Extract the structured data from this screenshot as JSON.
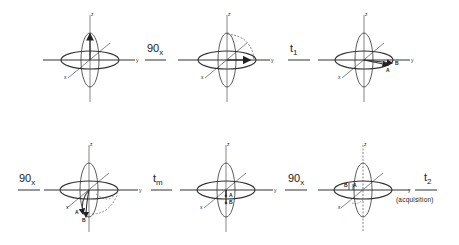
{
  "figure": {
    "type": "NMR pulse sequence vector diagram",
    "axes_labels": {
      "z": "z",
      "y": "y",
      "x": "x"
    },
    "steps": [
      {
        "id": "step1",
        "label": "",
        "description": "Equilibrium magnetization along z"
      },
      {
        "id": "step2",
        "arrow_label_main": "90",
        "arrow_label_sub": "x",
        "description": "After 90x pulse, magnetization rotated to y axis"
      },
      {
        "id": "step3",
        "arrow_label_main": "t",
        "arrow_label_sub": "1",
        "description": "Evolution during t1: vectors A and B dephase in xy plane"
      },
      {
        "id": "step4",
        "arrow_label_main": "90",
        "arrow_label_sub": "x",
        "description": "Second 90x pulse rotates A and B components toward -z"
      },
      {
        "id": "step5",
        "arrow_label_main": "t",
        "arrow_label_sub": "m",
        "description": "Mixing time tm: z components A and B remain"
      },
      {
        "id": "step6",
        "arrow_label_main": "90",
        "arrow_label_sub": "x",
        "description": "Third 90x pulse returns A and B to xy plane"
      }
    ],
    "final_arrow": {
      "main": "t",
      "sub": "2",
      "note": "(acquisition)"
    },
    "vector_labels": {
      "a": "A",
      "b": "B"
    }
  }
}
